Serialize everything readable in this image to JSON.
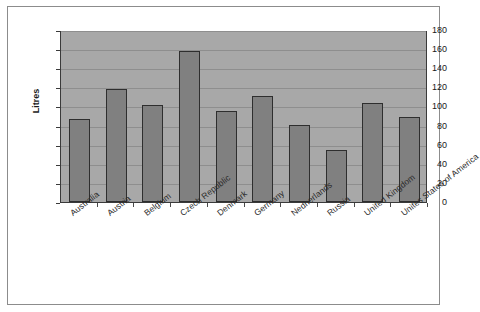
{
  "chart_data": {
    "type": "bar",
    "title": "",
    "xlabel": "",
    "ylabel": "Litres",
    "ylim": [
      0,
      180
    ],
    "ytick_step": 20,
    "grid": true,
    "legend": "none",
    "categories": [
      "Australia",
      "Austria",
      "Belgium",
      "Czech Republic",
      "Denmark",
      "Germany",
      "Nedherlands",
      "Russia",
      "United Kingdom",
      "Unites States of America"
    ],
    "values": [
      87,
      118,
      102,
      158,
      95,
      111,
      81,
      54,
      104,
      89
    ],
    "ytick_labels": [
      "0",
      "20",
      "40",
      "60",
      "80",
      "100",
      "120",
      "140",
      "160",
      "180"
    ],
    "series": [
      {
        "name": "Litres",
        "values": [
          87,
          118,
          102,
          158,
          95,
          111,
          81,
          54,
          104,
          89
        ]
      }
    ]
  },
  "style": {
    "plot_background": "#a8a8a8",
    "bar_fill": "#808080",
    "bar_border": "#2e2e2e",
    "gridline_color": "#8e8e8e",
    "axis_color": "#3a3a3a",
    "text_color": "#1a1a1a",
    "page_background": "#ffffff",
    "frame_border": "#8c8c8c"
  }
}
